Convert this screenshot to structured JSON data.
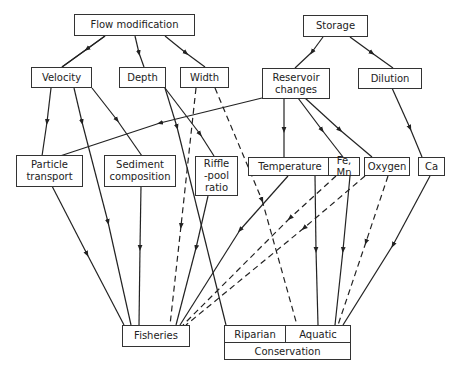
{
  "diagram": {
    "nodes": {
      "flow_modification": "Flow modification",
      "storage": "Storage",
      "velocity": "Velocity",
      "depth": "Depth",
      "width": "Width",
      "reservoir_changes": "Reservoir\nchanges",
      "dilution": "Dilution",
      "particle_transport": "Particle\ntransport",
      "sediment_composition": "Sediment\ncomposition",
      "riffle_pool_ratio": "Riffle\n-pool\nratio",
      "temperature": "Temperature",
      "fe_mn": "Fe, Mn",
      "oxygen": "Oxygen",
      "ca": "Ca",
      "fisheries": "Fisheries",
      "riparian": "Riparian",
      "aquatic": "Aquatic",
      "conservation": "Conservation"
    },
    "edges": [
      {
        "from": "Flow modification",
        "to": "Velocity",
        "style": "solid"
      },
      {
        "from": "Flow modification",
        "to": "Depth",
        "style": "solid"
      },
      {
        "from": "Flow modification",
        "to": "Width",
        "style": "solid"
      },
      {
        "from": "Storage",
        "to": "Reservoir changes",
        "style": "solid"
      },
      {
        "from": "Storage",
        "to": "Dilution",
        "style": "solid"
      },
      {
        "from": "Velocity",
        "to": "Particle transport",
        "style": "solid"
      },
      {
        "from": "Velocity",
        "to": "Fisheries",
        "style": "solid"
      },
      {
        "from": "Velocity",
        "to": "Sediment composition",
        "style": "solid"
      },
      {
        "from": "Depth",
        "to": "Riffle-pool ratio",
        "style": "solid"
      },
      {
        "from": "Depth",
        "to": "Conservation (Riparian)",
        "style": "solid"
      },
      {
        "from": "Width",
        "to": "Fisheries",
        "style": "dashed"
      },
      {
        "from": "Width",
        "to": "Aquatic",
        "style": "dashed"
      },
      {
        "from": "Reservoir changes",
        "to": "Particle transport",
        "style": "solid"
      },
      {
        "from": "Reservoir changes",
        "to": "Temperature",
        "style": "solid"
      },
      {
        "from": "Reservoir changes",
        "to": "Fe, Mn",
        "style": "solid"
      },
      {
        "from": "Reservoir changes",
        "to": "Oxygen",
        "style": "solid"
      },
      {
        "from": "Dilution",
        "to": "Ca",
        "style": "solid"
      },
      {
        "from": "Particle transport",
        "to": "Fisheries",
        "style": "solid"
      },
      {
        "from": "Sediment composition",
        "to": "Fisheries",
        "style": "solid"
      },
      {
        "from": "Riffle-pool ratio",
        "to": "Fisheries",
        "style": "solid"
      },
      {
        "from": "Temperature",
        "to": "Fisheries",
        "style": "solid"
      },
      {
        "from": "Temperature",
        "to": "Aquatic",
        "style": "solid"
      },
      {
        "from": "Fe, Mn",
        "to": "Fisheries",
        "style": "dashed"
      },
      {
        "from": "Fe, Mn",
        "to": "Aquatic",
        "style": "solid"
      },
      {
        "from": "Oxygen",
        "to": "Fisheries",
        "style": "dashed"
      },
      {
        "from": "Oxygen",
        "to": "Aquatic",
        "style": "dashed"
      },
      {
        "from": "Ca",
        "to": "Aquatic",
        "style": "solid"
      }
    ]
  }
}
